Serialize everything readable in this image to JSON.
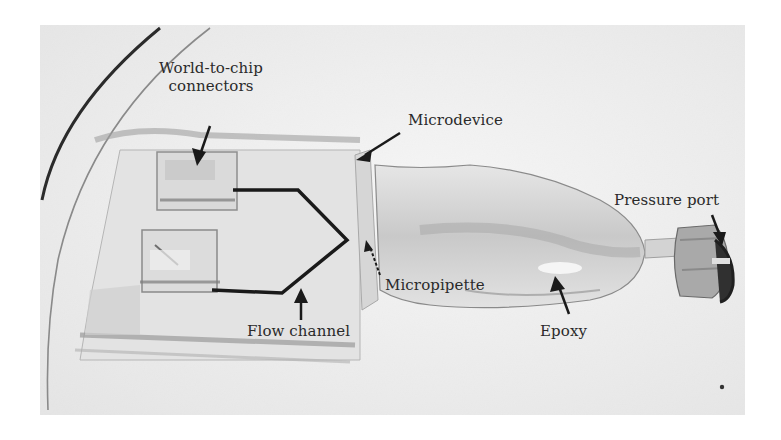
{
  "figure": {
    "type": "annotated-photograph",
    "colors": {
      "background": "#ffffff",
      "photo_base": "#ececec",
      "annotation": "#1a1a1a",
      "label_text": "#2a2a2a"
    },
    "labels": {
      "world_to_chip_line1": "World-to-chip",
      "world_to_chip_line2": "connectors",
      "microdevice": "Microdevice",
      "pressure_port": "Pressure port",
      "micropipette": "Micropipette",
      "flow_channel": "Flow channel",
      "epoxy": "Epoxy"
    }
  }
}
